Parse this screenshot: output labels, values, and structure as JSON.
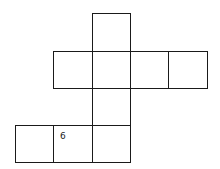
{
  "diagram": {
    "type": "cube-net",
    "cells": [
      {
        "id": "top",
        "x": 92,
        "y": 13,
        "w": 39,
        "h": 39,
        "label": ""
      },
      {
        "id": "row2-a",
        "x": 53,
        "y": 51,
        "w": 40,
        "h": 38,
        "label": ""
      },
      {
        "id": "row2-b",
        "x": 92,
        "y": 51,
        "w": 39,
        "h": 38,
        "label": ""
      },
      {
        "id": "row2-c",
        "x": 130,
        "y": 51,
        "w": 39,
        "h": 38,
        "label": ""
      },
      {
        "id": "row2-d",
        "x": 168,
        "y": 51,
        "w": 40,
        "h": 38,
        "label": ""
      },
      {
        "id": "row3",
        "x": 92,
        "y": 88,
        "w": 39,
        "h": 38,
        "label": ""
      },
      {
        "id": "row4-a",
        "x": 15,
        "y": 125,
        "w": 39,
        "h": 38,
        "label": ""
      },
      {
        "id": "row4-b",
        "x": 53,
        "y": 125,
        "w": 40,
        "h": 38,
        "label": "6"
      },
      {
        "id": "row4-c",
        "x": 92,
        "y": 125,
        "w": 39,
        "h": 38,
        "label": ""
      }
    ]
  }
}
